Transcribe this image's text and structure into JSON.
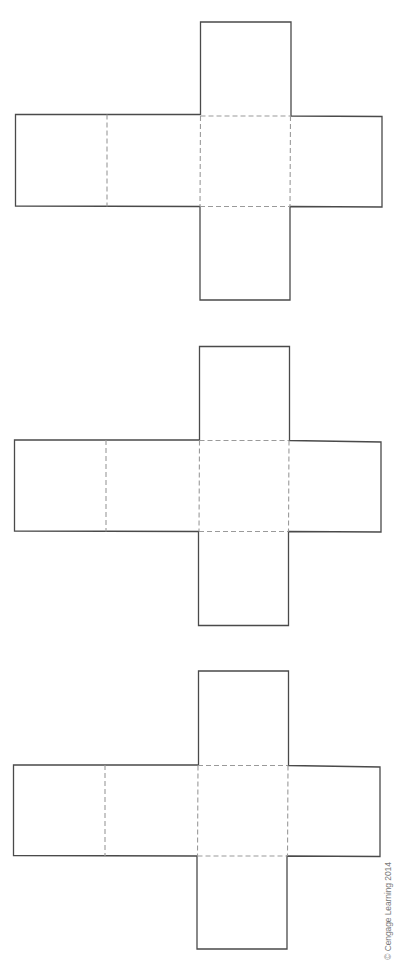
{
  "figure": {
    "colors": {
      "background": "#ffffff",
      "cut_line": "#4a4a4a",
      "fold_line": "#9a9a9a"
    },
    "nets": [
      {
        "id": "net-1",
        "top_square": {
          "x1": 200.5,
          "y1": 22,
          "x2": 291,
          "y2": 115.5
        },
        "row": {
          "x1": 15.5,
          "y1": 114.5,
          "x2": 382,
          "y2": 207
        },
        "bottom_square": {
          "x1": 200,
          "y1": 206,
          "x2": 290,
          "y2": 300
        },
        "folds_x": [
          107,
          200.5,
          290.5
        ],
        "folds_y": [
          116,
          206.5
        ]
      },
      {
        "id": "net-2",
        "top_square": {
          "x1": 199.5,
          "y1": 346.5,
          "x2": 289.5,
          "y2": 440.5
        },
        "row": {
          "x1": 14.5,
          "y1": 440,
          "x2": 381,
          "y2": 532
        },
        "bottom_square": {
          "x1": 198.5,
          "y1": 531,
          "x2": 288.5,
          "y2": 625.5
        },
        "folds_x": [
          106,
          199.5,
          289
        ],
        "folds_y": [
          440.5,
          531.5
        ]
      },
      {
        "id": "net-3",
        "top_square": {
          "x1": 198.5,
          "y1": 671,
          "x2": 288.5,
          "y2": 765.5
        },
        "row": {
          "x1": 13.5,
          "y1": 765,
          "x2": 380,
          "y2": 856.5
        },
        "bottom_square": {
          "x1": 197,
          "y1": 856,
          "x2": 287,
          "y2": 949
        },
        "folds_x": [
          105,
          198,
          288
        ],
        "folds_y": [
          765.5,
          856
        ]
      }
    ],
    "credit": "© Cengage Learning 2014"
  }
}
